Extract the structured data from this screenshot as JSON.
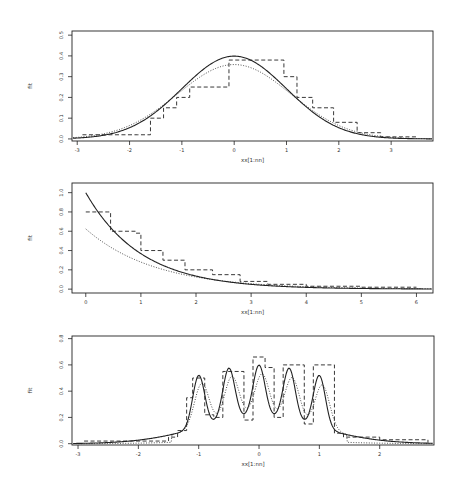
{
  "figure": {
    "background": "#ffffff",
    "ink": "#222222"
  },
  "chart_data": [
    {
      "type": "line",
      "title": "",
      "xlabel": "xx[1:nn]",
      "ylabel": "fit",
      "xlim": [
        -3.1,
        3.8
      ],
      "ylim": [
        -0.01,
        0.52
      ],
      "xticks": [
        -3,
        -2,
        -1,
        0,
        1,
        2,
        3
      ],
      "xtick_labels": [
        "-3",
        "-2",
        "-1",
        "0",
        "1",
        "2",
        "3"
      ],
      "yticks": [
        0.0,
        0.1,
        0.2,
        0.3,
        0.4,
        0.5
      ],
      "ytick_labels": [
        "0.0",
        "0.1",
        "0.2",
        "0.3",
        "0.4",
        "0.5"
      ],
      "grid": false,
      "frame_px": {
        "left": 72,
        "top": 31,
        "right": 433,
        "bottom": 141
      },
      "series": [
        {
          "name": "true density (normal)",
          "style": "solid",
          "func": "normal",
          "params": {
            "mu": 0,
            "sd": 1
          }
        },
        {
          "name": "smoothed estimate",
          "style": "dotted",
          "func": "normal",
          "params": {
            "mu": 0,
            "sd": 1.08
          },
          "scale": 0.97
        },
        {
          "name": "histogram estimate",
          "style": "dashed",
          "steps": {
            "x": [
              -2.9,
              -1.85,
              -1.6,
              -1.35,
              -1.1,
              -0.85,
              -0.1,
              0.55,
              0.95,
              1.2,
              1.5,
              1.9,
              2.35,
              2.8,
              3.5
            ],
            "y": [
              0.02,
              0.02,
              0.1,
              0.15,
              0.2,
              0.25,
              0.38,
              0.38,
              0.3,
              0.2,
              0.15,
              0.08,
              0.03,
              0.01,
              0.01
            ]
          }
        }
      ]
    },
    {
      "type": "line",
      "title": "",
      "xlabel": "xx[1:nn]",
      "ylabel": "fit",
      "xlim": [
        -0.25,
        6.3
      ],
      "ylim": [
        -0.04,
        1.1
      ],
      "xticks": [
        0,
        1,
        2,
        3,
        4,
        5,
        6
      ],
      "xtick_labels": [
        "0",
        "1",
        "2",
        "3",
        "4",
        "5",
        "6"
      ],
      "yticks": [
        0.0,
        0.2,
        0.4,
        0.6,
        0.8,
        1.0
      ],
      "ytick_labels": [
        "0.0",
        "0.2",
        "0.4",
        "0.6",
        "0.8",
        "1.0"
      ],
      "grid": false,
      "frame_px": {
        "left": 72,
        "top": 183,
        "right": 433,
        "bottom": 293
      },
      "series": [
        {
          "name": "true density (exponential)",
          "style": "solid",
          "func": "exp",
          "params": {
            "rate": 1.0
          }
        },
        {
          "name": "smoothed estimate",
          "style": "dotted",
          "func": "exp",
          "params": {
            "rate": 0.8
          },
          "scale": 0.78
        },
        {
          "name": "histogram estimate",
          "style": "dashed",
          "steps": {
            "x": [
              0.0,
              0.4,
              0.45,
              0.9,
              1.0,
              1.4,
              1.8,
              2.3,
              2.8,
              3.3,
              4.0,
              5.0,
              6.0
            ],
            "y": [
              0.8,
              0.8,
              0.6,
              0.58,
              0.4,
              0.3,
              0.2,
              0.15,
              0.08,
              0.05,
              0.03,
              0.02,
              0.02
            ]
          }
        }
      ]
    },
    {
      "type": "line",
      "title": "",
      "xlabel": "xx[1:nn]",
      "ylabel": "fit",
      "xlim": [
        -3.1,
        2.9
      ],
      "ylim": [
        -0.01,
        0.82
      ],
      "xticks": [
        -3,
        -2,
        -1,
        0,
        1,
        2
      ],
      "xtick_labels": [
        "-3",
        "-2",
        "-1",
        "0",
        "1",
        "2"
      ],
      "yticks": [
        0.0,
        0.2,
        0.4,
        0.6,
        0.8
      ],
      "ytick_labels": [
        "0.0",
        "0.2",
        "0.4",
        "0.6",
        "0.8"
      ],
      "grid": false,
      "frame_px": {
        "left": 72,
        "top": 336,
        "right": 434,
        "bottom": 445
      },
      "series": [
        {
          "name": "true density (claw mixture)",
          "style": "solid",
          "func": "claw",
          "params": {
            "peak_sd": 0.1
          }
        },
        {
          "name": "smoothed estimate",
          "style": "dotted",
          "func": "claw",
          "params": {
            "peak_sd": 0.12,
            "shift": 0.05,
            "trunc": 1.45
          }
        },
        {
          "name": "histogram estimate",
          "style": "dashed",
          "steps": {
            "x": [
              -2.9,
              -1.5,
              -1.35,
              -1.2,
              -1.1,
              -0.9,
              -0.75,
              -0.6,
              -0.4,
              -0.25,
              -0.1,
              0.1,
              0.25,
              0.4,
              0.6,
              0.75,
              0.9,
              1.1,
              1.25,
              1.4,
              2.0,
              2.8
            ],
            "y": [
              0.02,
              0.05,
              0.1,
              0.35,
              0.5,
              0.22,
              0.2,
              0.55,
              0.55,
              0.18,
              0.66,
              0.58,
              0.2,
              0.6,
              0.6,
              0.15,
              0.6,
              0.6,
              0.08,
              0.05,
              0.03,
              0.01
            ]
          }
        }
      ]
    }
  ]
}
